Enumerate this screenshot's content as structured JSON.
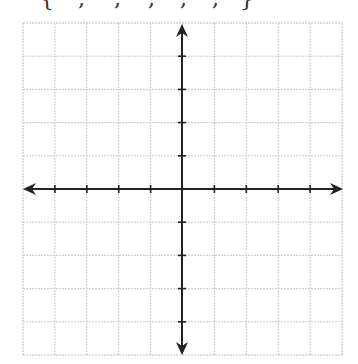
{
  "header": {
    "clipped_text_fragments": [
      {
        "glyph": "{",
        "x": 40
      },
      {
        "glyph": ",",
        "x": 78
      },
      {
        "glyph": ",",
        "x": 114
      },
      {
        "glyph": ",",
        "x": 148
      },
      {
        "glyph": ",",
        "x": 180
      },
      {
        "glyph": ",",
        "x": 212
      },
      {
        "glyph": "}",
        "x": 240
      }
    ]
  },
  "grid": {
    "left": 23,
    "top": 23,
    "right": 342,
    "bottom": 355,
    "columns": 10,
    "rows": 10,
    "line_color": "#c8c8c8",
    "border_color": "#bdbdbd"
  },
  "axes": {
    "origin_x": 182,
    "origin_y": 189,
    "color": "#222222",
    "x_range": [
      -5,
      5
    ],
    "y_range": [
      -5,
      5
    ],
    "tick_half_length": 4,
    "x_arrow_left_tip": 23,
    "x_arrow_right_tip": 343,
    "y_arrow_top_tip": 24,
    "y_arrow_bottom_tip": 355,
    "tick_labels_shown": false
  }
}
